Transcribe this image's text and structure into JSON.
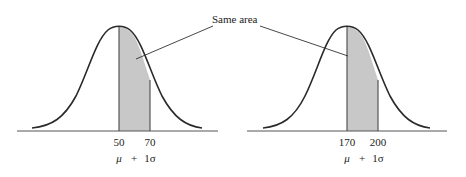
{
  "figure": {
    "callout_label": "Same area",
    "colors": {
      "curve": "#2a2a2a",
      "shade": "#c8c8c8",
      "axis": "#555555",
      "text": "#222222"
    },
    "panels": [
      {
        "name": "left-distribution",
        "mean_label": "50",
        "plus_one_sd_label": "70",
        "formula": {
          "mu": "μ",
          "plus": "+",
          "sigma": "1σ"
        }
      },
      {
        "name": "right-distribution",
        "mean_label": "170",
        "plus_one_sd_label": "200",
        "formula": {
          "mu": "μ",
          "plus": "+",
          "sigma": "1σ"
        }
      }
    ]
  }
}
